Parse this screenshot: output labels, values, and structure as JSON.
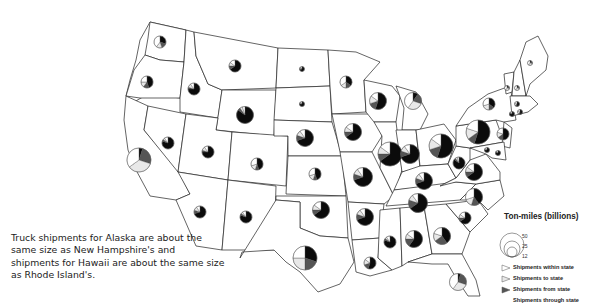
{
  "map": {
    "caption": "Truck shipments for Alaska are about the same size as New Hampshire's and shipments for Hawaii are about the same size as Rhode Island's.",
    "legend": {
      "title": "Ton-miles (billions)",
      "sizes": [
        "50",
        "25",
        "12"
      ],
      "items": [
        {
          "label": "Shipments within state",
          "category": "within",
          "color": "#ffffff"
        },
        {
          "label": "Shipments to state",
          "category": "to",
          "color": "#e8e8e8"
        },
        {
          "label": "Shipments from state",
          "category": "from",
          "color": "#555555"
        },
        {
          "label": "Shipments through state",
          "category": "through",
          "color": "#0b0b0b"
        }
      ]
    },
    "states": [
      {
        "name": "Washington",
        "size": "small",
        "shares": {
          "through": 0.3,
          "from": 0.15,
          "to": 0.15,
          "within": 0.4
        }
      },
      {
        "name": "Oregon",
        "size": "small",
        "shares": {
          "through": 0.45,
          "from": 0.15,
          "to": 0.15,
          "within": 0.25
        }
      },
      {
        "name": "California",
        "size": "large",
        "shares": {
          "through": 0.05,
          "from": 0.25,
          "to": 0.35,
          "within": 0.35
        }
      },
      {
        "name": "Idaho",
        "size": "small",
        "shares": {
          "through": 0.75,
          "from": 0.05,
          "to": 0.1,
          "within": 0.1
        }
      },
      {
        "name": "Nevada",
        "size": "small",
        "shares": {
          "through": 0.8,
          "from": 0.05,
          "to": 0.05,
          "within": 0.1
        }
      },
      {
        "name": "Montana",
        "size": "small",
        "shares": {
          "through": 0.65,
          "from": 0.1,
          "to": 0.1,
          "within": 0.15
        }
      },
      {
        "name": "Wyoming",
        "size": "medium",
        "shares": {
          "through": 0.85,
          "from": 0.05,
          "to": 0.05,
          "within": 0.05
        }
      },
      {
        "name": "Utah",
        "size": "small",
        "shares": {
          "through": 0.75,
          "from": 0.05,
          "to": 0.1,
          "within": 0.1
        }
      },
      {
        "name": "Colorado",
        "size": "small",
        "shares": {
          "through": 0.45,
          "from": 0.1,
          "to": 0.15,
          "within": 0.3
        }
      },
      {
        "name": "Arizona",
        "size": "small",
        "shares": {
          "through": 0.7,
          "from": 0.1,
          "to": 0.1,
          "within": 0.1
        }
      },
      {
        "name": "New Mexico",
        "size": "small",
        "shares": {
          "through": 0.8,
          "from": 0.05,
          "to": 0.05,
          "within": 0.1
        }
      },
      {
        "name": "North Dakota",
        "size": "tiny",
        "shares": {
          "through": 0.7,
          "from": 0.1,
          "to": 0.1,
          "within": 0.1
        }
      },
      {
        "name": "South Dakota",
        "size": "tiny",
        "shares": {
          "through": 0.75,
          "from": 0.05,
          "to": 0.1,
          "within": 0.1
        }
      },
      {
        "name": "Nebraska",
        "size": "medium",
        "shares": {
          "through": 0.7,
          "from": 0.1,
          "to": 0.1,
          "within": 0.1
        }
      },
      {
        "name": "Kansas",
        "size": "small",
        "shares": {
          "through": 0.45,
          "from": 0.1,
          "to": 0.15,
          "within": 0.3
        }
      },
      {
        "name": "Oklahoma",
        "size": "medium",
        "shares": {
          "through": 0.65,
          "from": 0.1,
          "to": 0.1,
          "within": 0.15
        }
      },
      {
        "name": "Texas",
        "size": "large",
        "shares": {
          "through": 0.3,
          "from": 0.2,
          "to": 0.25,
          "within": 0.25
        }
      },
      {
        "name": "Minnesota",
        "size": "small",
        "shares": {
          "through": 0.35,
          "from": 0.15,
          "to": 0.15,
          "within": 0.35
        }
      },
      {
        "name": "Iowa",
        "size": "medium",
        "shares": {
          "through": 0.65,
          "from": 0.1,
          "to": 0.1,
          "within": 0.15
        }
      },
      {
        "name": "Missouri",
        "size": "medium-large",
        "shares": {
          "through": 0.7,
          "from": 0.1,
          "to": 0.1,
          "within": 0.1
        }
      },
      {
        "name": "Arkansas",
        "size": "medium",
        "shares": {
          "through": 0.7,
          "from": 0.1,
          "to": 0.1,
          "within": 0.1
        }
      },
      {
        "name": "Louisiana",
        "size": "small",
        "shares": {
          "through": 0.55,
          "from": 0.15,
          "to": 0.15,
          "within": 0.15
        }
      },
      {
        "name": "Wisconsin",
        "size": "medium",
        "shares": {
          "through": 0.55,
          "from": 0.15,
          "to": 0.15,
          "within": 0.15
        }
      },
      {
        "name": "Michigan",
        "size": "medium",
        "shares": {
          "through": 0.1,
          "from": 0.2,
          "to": 0.3,
          "within": 0.4
        }
      },
      {
        "name": "Illinois",
        "size": "large",
        "shares": {
          "through": 0.65,
          "from": 0.1,
          "to": 0.1,
          "within": 0.15
        }
      },
      {
        "name": "Indiana",
        "size": "medium-large",
        "shares": {
          "through": 0.7,
          "from": 0.1,
          "to": 0.1,
          "within": 0.1
        }
      },
      {
        "name": "Ohio",
        "size": "large",
        "shares": {
          "through": 0.55,
          "from": 0.15,
          "to": 0.15,
          "within": 0.15
        }
      },
      {
        "name": "Kentucky",
        "size": "medium",
        "shares": {
          "through": 0.7,
          "from": 0.1,
          "to": 0.1,
          "within": 0.1
        }
      },
      {
        "name": "Tennessee",
        "size": "medium-large",
        "shares": {
          "through": 0.65,
          "from": 0.15,
          "to": 0.1,
          "within": 0.1
        }
      },
      {
        "name": "Mississippi",
        "size": "small",
        "shares": {
          "through": 0.8,
          "from": 0.05,
          "to": 0.05,
          "within": 0.1
        }
      },
      {
        "name": "Alabama",
        "size": "medium",
        "shares": {
          "through": 0.6,
          "from": 0.15,
          "to": 0.1,
          "within": 0.15
        }
      },
      {
        "name": "Georgia",
        "size": "medium",
        "shares": {
          "through": 0.4,
          "from": 0.25,
          "to": 0.15,
          "within": 0.2
        }
      },
      {
        "name": "Florida",
        "size": "medium",
        "shares": {
          "through": 0.05,
          "from": 0.25,
          "to": 0.3,
          "within": 0.4
        }
      },
      {
        "name": "South Carolina",
        "size": "small",
        "shares": {
          "through": 0.65,
          "from": 0.1,
          "to": 0.1,
          "within": 0.15
        }
      },
      {
        "name": "North Carolina",
        "size": "medium",
        "shares": {
          "through": 0.4,
          "from": 0.15,
          "to": 0.15,
          "within": 0.3
        }
      },
      {
        "name": "Virginia",
        "size": "medium",
        "shares": {
          "through": 0.65,
          "from": 0.1,
          "to": 0.1,
          "within": 0.15
        }
      },
      {
        "name": "West Virginia",
        "size": "small",
        "shares": {
          "through": 0.85,
          "from": 0.05,
          "to": 0.05,
          "within": 0.05
        }
      },
      {
        "name": "Pennsylvania",
        "size": "large",
        "shares": {
          "through": 0.55,
          "from": 0.1,
          "to": 0.15,
          "within": 0.2
        }
      },
      {
        "name": "New York",
        "size": "small",
        "shares": {
          "through": 0.35,
          "from": 0.15,
          "to": 0.2,
          "within": 0.3
        }
      },
      {
        "name": "New Jersey",
        "size": "small",
        "shares": {
          "through": 0.5,
          "from": 0.15,
          "to": 0.15,
          "within": 0.2
        }
      },
      {
        "name": "Maryland",
        "size": "tiny",
        "shares": {
          "through": 0.75,
          "from": 0.05,
          "to": 0.1,
          "within": 0.1
        }
      },
      {
        "name": "Delaware",
        "size": "tiny",
        "shares": {
          "through": 0.8,
          "from": 0.05,
          "to": 0.05,
          "within": 0.1
        }
      },
      {
        "name": "Connecticut",
        "size": "tiny",
        "shares": {
          "through": 0.8,
          "from": 0.05,
          "to": 0.05,
          "within": 0.1
        }
      },
      {
        "name": "Rhode Island",
        "size": "tiny",
        "shares": {
          "through": 0.5,
          "from": 0.1,
          "to": 0.2,
          "within": 0.2
        }
      },
      {
        "name": "Massachusetts",
        "size": "tiny",
        "shares": {
          "through": 0.5,
          "from": 0.15,
          "to": 0.15,
          "within": 0.2
        }
      },
      {
        "name": "Vermont",
        "size": "tiny",
        "shares": {
          "through": 0.1,
          "from": 0.2,
          "to": 0.3,
          "within": 0.4
        }
      },
      {
        "name": "New Hampshire",
        "size": "tiny",
        "shares": {
          "through": 0.1,
          "from": 0.2,
          "to": 0.3,
          "within": 0.4
        }
      },
      {
        "name": "Maine",
        "size": "tiny",
        "shares": {
          "through": 0.1,
          "from": 0.2,
          "to": 0.3,
          "within": 0.4
        }
      }
    ]
  }
}
